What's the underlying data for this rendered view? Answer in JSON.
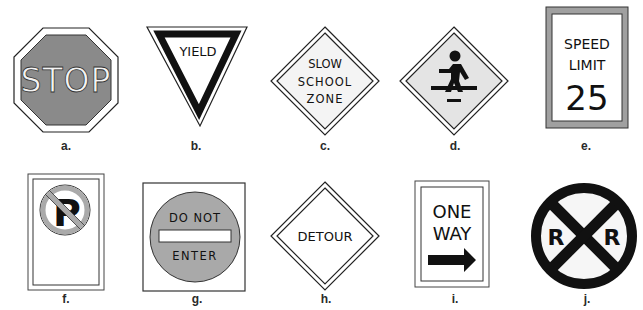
{
  "colors": {
    "stop_fill": "#8a8a8a",
    "dne_fill": "#a9a9a9",
    "speed_border": "#a0a0a0",
    "ink": "#111111",
    "diamond_fill": "#e4e4e4"
  },
  "signs": [
    {
      "id": "a",
      "label": "a.",
      "type": "stop",
      "text": "STOP"
    },
    {
      "id": "b",
      "label": "b.",
      "type": "yield",
      "text": "YIELD"
    },
    {
      "id": "c",
      "label": "c.",
      "type": "slow-school-zone",
      "lines": [
        "SLOW",
        "SCHOOL",
        "ZONE"
      ]
    },
    {
      "id": "d",
      "label": "d.",
      "type": "pedestrian-crossing",
      "icon": "pedestrian-icon"
    },
    {
      "id": "e",
      "label": "e.",
      "type": "speed-limit",
      "lines": [
        "SPEED",
        "LIMIT",
        "25"
      ]
    },
    {
      "id": "f",
      "label": "f.",
      "type": "no-parking",
      "icon": "no-parking-icon",
      "text": "P"
    },
    {
      "id": "g",
      "label": "g.",
      "type": "do-not-enter",
      "lines": [
        "DO NOT",
        "ENTER"
      ]
    },
    {
      "id": "h",
      "label": "h.",
      "type": "detour",
      "text": "DETOUR"
    },
    {
      "id": "i",
      "label": "i.",
      "type": "one-way",
      "lines": [
        "ONE",
        "WAY"
      ],
      "icon": "right-arrow-icon"
    },
    {
      "id": "j",
      "label": "j.",
      "type": "railroad-crossing",
      "letters": [
        "R",
        "R"
      ]
    }
  ]
}
